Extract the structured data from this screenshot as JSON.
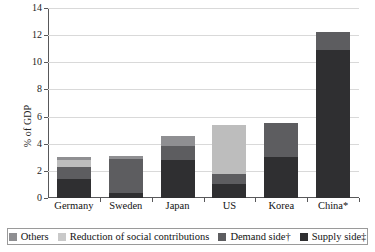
{
  "chart_data": {
    "type": "bar",
    "subtype": "stacked-bar",
    "title": "",
    "xlabel": "",
    "ylabel": "% of GDP",
    "ylim": [
      0,
      14
    ],
    "yticks": [
      0,
      2,
      4,
      6,
      8,
      10,
      12,
      14
    ],
    "grid": true,
    "legend_position": "bottom",
    "categories": [
      "Germany",
      "Sweden",
      "Japan",
      "US",
      "Korea",
      "China*"
    ],
    "series": [
      {
        "name": "Supply side‡",
        "color": "#2f2f31",
        "values": [
          1.4,
          0.4,
          2.8,
          1.0,
          3.0,
          10.9
        ]
      },
      {
        "name": "Demand side†",
        "color": "#5d5d60",
        "values": [
          0.9,
          2.5,
          1.0,
          0.8,
          2.5,
          1.3
        ]
      },
      {
        "name": "Reduction of social contributions",
        "color": "#bdbdbd",
        "values": [
          0.5,
          0.0,
          0.0,
          3.6,
          0.0,
          0.0
        ]
      },
      {
        "name": "Others",
        "color": "#8f8f92",
        "values": [
          0.2,
          0.2,
          0.8,
          0.0,
          0.0,
          0.0
        ]
      }
    ],
    "totals": [
      3.0,
      3.1,
      4.6,
      5.4,
      5.5,
      12.2
    ]
  },
  "legend": {
    "items": [
      {
        "label": "Others",
        "color": "#8f8f92"
      },
      {
        "label": "Reduction of social contributions",
        "color": "#c9c9c9"
      },
      {
        "label": "Demand side†",
        "color": "#5d5d60"
      },
      {
        "label": "Supply side‡",
        "color": "#2f2f31"
      }
    ]
  },
  "axis": {
    "y_title": "% of GDP",
    "y_tick_labels": [
      "0",
      "2",
      "4",
      "6",
      "8",
      "10",
      "12",
      "14"
    ],
    "x_tick_labels": [
      "Germany",
      "Sweden",
      "Japan",
      "US",
      "Korea",
      "China*"
    ]
  }
}
